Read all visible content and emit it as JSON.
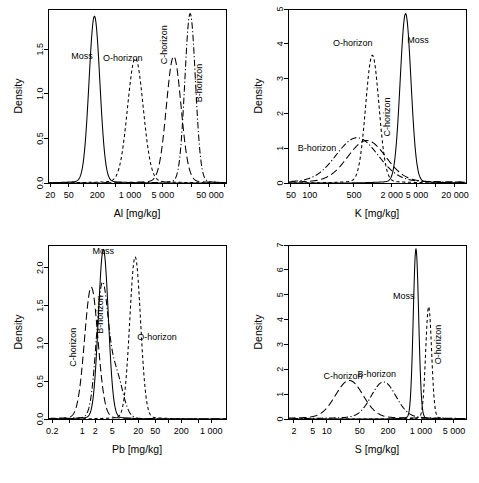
{
  "figure": {
    "background": "#ffffff",
    "ink": "#000000",
    "panel_count": 4,
    "layout": "2x2 grid of kernel density plots on log-scaled x axes"
  },
  "styles": {
    "Moss": "solid",
    "O-horizon": "dashed",
    "C-horizon": "longdash",
    "B-horizon": "dotdash"
  },
  "chart_data": [
    {
      "id": "panel-al",
      "type": "line",
      "title": "",
      "xlabel": "Al [mg/kg]",
      "ylabel": "Density",
      "xscale": "log",
      "xlim": [
        18,
        110000
      ],
      "ylim": [
        0,
        1.95
      ],
      "xticks": [
        20,
        50,
        200,
        1000,
        5000,
        50000
      ],
      "xticklabels": [
        "20",
        "50",
        "200",
        "1 000",
        "5 000",
        "50 000"
      ],
      "yticks": [
        0.0,
        0.5,
        1.0,
        1.5
      ],
      "yticklabels": [
        "0.0",
        "0.5",
        "1.0",
        "1.5"
      ],
      "minor_xticks": [
        100,
        500,
        2000,
        10000,
        20000,
        100000
      ],
      "grid": false,
      "legend": "inline-annotations",
      "series": [
        {
          "name": "Moss",
          "style": "solid",
          "label_x": 95,
          "label_y": 1.42,
          "label_rotation": 0,
          "mode": "lognormal",
          "peak_x": 175,
          "peak_y": 1.85,
          "log10_sigma": 0.115
        },
        {
          "name": "O-horizon",
          "style": "dashed",
          "label_x": 700,
          "label_y": 1.4,
          "label_rotation": 0,
          "mode": "lognormal",
          "peak_x": 1300,
          "peak_y": 1.38,
          "log10_sigma": 0.165
        },
        {
          "name": "C-horizon",
          "style": "longdash",
          "label_x": 5200,
          "label_y": 1.55,
          "label_rotation": -90,
          "mode": "lognormal",
          "peak_x": 8500,
          "peak_y": 1.4,
          "log10_sigma": 0.155
        },
        {
          "name": "B-horizon",
          "style": "dotdash",
          "label_x": 30000,
          "label_y": 1.12,
          "label_rotation": -90,
          "mode": "lognormal",
          "peak_x": 19000,
          "peak_y": 1.88,
          "log10_sigma": 0.112
        }
      ]
    },
    {
      "id": "panel-k",
      "type": "line",
      "title": "",
      "xlabel": "K [mg/kg]",
      "ylabel": "Density",
      "xscale": "log",
      "xlim": [
        45,
        30000
      ],
      "ylim": [
        0,
        5.0
      ],
      "xticks": [
        50,
        100,
        500,
        2000,
        5000,
        20000
      ],
      "xticklabels": [
        "50",
        "100",
        "500",
        "2 000",
        "5 000",
        "20 000"
      ],
      "yticks": [
        0,
        1,
        2,
        3,
        4,
        5
      ],
      "yticklabels": [
        "0",
        "1",
        "2",
        "3",
        "4",
        "5"
      ],
      "minor_xticks": [
        200,
        1000,
        10000
      ],
      "grid": false,
      "legend": "inline-annotations",
      "series": [
        {
          "name": "B-horizon",
          "style": "dotdash",
          "label_x": 130,
          "label_y": 1.02,
          "label_rotation": 0,
          "mode": "lognormal",
          "peak_x": 560,
          "peak_y": 1.25,
          "log10_sigma": 0.33
        },
        {
          "name": "O-horizon",
          "style": "dashed",
          "label_x": 480,
          "label_y": 4.02,
          "label_rotation": 0,
          "mode": "lognormal",
          "peak_x": 980,
          "peak_y": 3.62,
          "log10_sigma": 0.105
        },
        {
          "name": "C-horizon",
          "style": "longdash",
          "label_x": 1700,
          "label_y": 1.9,
          "label_rotation": -90,
          "mode": "lognormal",
          "peak_x": 800,
          "peak_y": 1.17,
          "log10_sigma": 0.3
        },
        {
          "name": "Moss",
          "style": "solid",
          "label_x": 5200,
          "label_y": 4.1,
          "label_rotation": 0,
          "mode": "lognormal",
          "peak_x": 3300,
          "peak_y": 4.82,
          "log10_sigma": 0.085
        }
      ]
    },
    {
      "id": "panel-pb",
      "type": "line",
      "title": "",
      "xlabel": "Pb [mg/kg]",
      "ylabel": "Density",
      "xscale": "log",
      "xlim": [
        0.16,
        2200
      ],
      "ylim": [
        0,
        2.3
      ],
      "xticks": [
        0.2,
        1,
        2,
        5,
        20,
        50,
        200,
        1000
      ],
      "xticklabels": [
        "0.2",
        "1",
        "2",
        "5",
        "20",
        "50",
        "200",
        "1 000"
      ],
      "yticks": [
        0.0,
        0.5,
        1.0,
        1.5,
        2.0
      ],
      "yticklabels": [
        "0.0",
        "0.5",
        "1.0",
        "1.5",
        "2.0"
      ],
      "minor_xticks": [
        0.5,
        10,
        100,
        500
      ],
      "grid": false,
      "legend": "inline-annotations",
      "series": [
        {
          "name": "C-horizon",
          "style": "longdash",
          "label_x": 0.62,
          "label_y": 0.95,
          "label_rotation": -90,
          "mode": "lognormal",
          "peak_x": 1.62,
          "peak_y": 1.72,
          "log10_sigma": 0.155
        },
        {
          "name": "B-horizon",
          "style": "dotdash",
          "label_x": 2.6,
          "label_y": 1.38,
          "label_rotation": -90,
          "mode": "bimodal",
          "peak_x": 2.9,
          "peak_y": 1.7,
          "log10_sigma": 0.135,
          "secondary_peak_x": 6.0,
          "secondary_peak_y": 0.58,
          "secondary_sigma": 0.16
        },
        {
          "name": "Moss",
          "style": "solid",
          "label_x": 3.1,
          "label_y": 2.22,
          "label_rotation": 0,
          "mode": "lognormal",
          "peak_x": 3.1,
          "peak_y": 2.22,
          "log10_sigma": 0.115
        },
        {
          "name": "O-horizon",
          "style": "dashed",
          "label_x": 55,
          "label_y": 1.08,
          "label_rotation": 0,
          "mode": "lognormal",
          "peak_x": 17,
          "peak_y": 2.12,
          "log10_sigma": 0.125
        }
      ]
    },
    {
      "id": "panel-s",
      "type": "line",
      "title": "",
      "xlabel": "S [mg/kg]",
      "ylabel": "Density",
      "xscale": "log",
      "xlim": [
        1.5,
        9000
      ],
      "ylim": [
        0,
        7.0
      ],
      "xticks": [
        2,
        5,
        10,
        50,
        200,
        1000,
        5000
      ],
      "xticklabels": [
        "2",
        "5",
        "10",
        "50",
        "200",
        "1 000",
        "5 000"
      ],
      "yticks": [
        0,
        1,
        2,
        3,
        4,
        5,
        6,
        7
      ],
      "yticklabels": [
        "0",
        "1",
        "2",
        "3",
        "4",
        "5",
        "6",
        "7"
      ],
      "minor_xticks": [
        20,
        100,
        500,
        2000
      ],
      "grid": false,
      "legend": "inline-annotations",
      "series": [
        {
          "name": "C-horizon",
          "style": "longdash",
          "label_x": 22,
          "label_y": 1.72,
          "label_rotation": 0,
          "mode": "lognormal",
          "peak_x": 30,
          "peak_y": 1.48,
          "log10_sigma": 0.29
        },
        {
          "name": "B-horizon",
          "style": "dotdash",
          "label_x": 115,
          "label_y": 1.82,
          "label_rotation": 0,
          "mode": "lognormal",
          "peak_x": 160,
          "peak_y": 1.42,
          "log10_sigma": 0.26
        },
        {
          "name": "Moss",
          "style": "solid",
          "label_x": 430,
          "label_y": 4.95,
          "label_rotation": 0,
          "mode": "lognormal",
          "peak_x": 780,
          "peak_y": 6.78,
          "log10_sigma": 0.057
        },
        {
          "name": "O-horizon",
          "style": "dashed",
          "label_x": 2300,
          "label_y": 3.0,
          "label_rotation": -90,
          "mode": "lognormal",
          "peak_x": 1450,
          "peak_y": 4.45,
          "log10_sigma": 0.062
        }
      ]
    }
  ]
}
